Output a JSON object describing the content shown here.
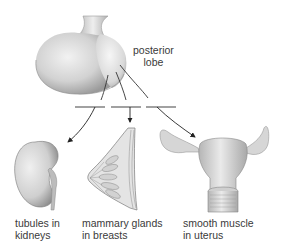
{
  "diagram": {
    "type": "anatomy-flow",
    "source_label": {
      "line1": "posterior",
      "line2": "lobe"
    },
    "targets": [
      {
        "id": "kidney",
        "line1": "tubules in",
        "line2": "kidneys"
      },
      {
        "id": "breast",
        "line1": "mammary glands",
        "line2": "in breasts"
      },
      {
        "id": "uterus",
        "line1": "smooth muscle",
        "line2": "in uterus"
      }
    ],
    "colors": {
      "text": "#3a3a3a",
      "line": "#333333",
      "bar": "#8a8a8a",
      "organ_fill": "#dcdcdc",
      "organ_shade": "#a8a8a8"
    }
  }
}
